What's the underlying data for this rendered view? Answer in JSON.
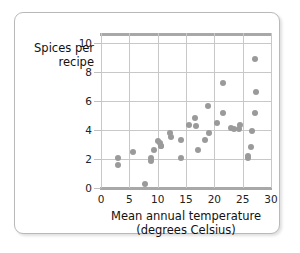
{
  "chart_data": {
    "type": "scatter",
    "title": "",
    "xlabel": "Mean annual temperature (degrees Celsius)",
    "xlabel_line1": "Mean annual temperature",
    "xlabel_line2": "(degrees Celsius)",
    "ylabel": "Spices per recipe",
    "ylabel_line1": "Spices per",
    "ylabel_line2": "recipe",
    "xlim": [
      0,
      30
    ],
    "ylim": [
      0,
      11
    ],
    "xticks": [
      0,
      5,
      10,
      15,
      20,
      25,
      30
    ],
    "yticks": [
      0,
      2,
      4,
      6,
      8,
      10
    ],
    "xtick_labels": [
      "0",
      "5",
      "10",
      "15",
      "20",
      "25",
      "30"
    ],
    "ytick_labels": [
      "0",
      "2",
      "4",
      "6",
      "8",
      "10"
    ],
    "grid": "both",
    "legend": "none",
    "marker_color": "#9a9a9a",
    "gridline_color": "#c8c8c8",
    "axis_color": "#a8a8a8",
    "points": [
      {
        "x": 3.0,
        "y": 2.1
      },
      {
        "x": 3.0,
        "y": 1.6
      },
      {
        "x": 5.6,
        "y": 2.5
      },
      {
        "x": 7.8,
        "y": 0.3
      },
      {
        "x": 8.9,
        "y": 2.1
      },
      {
        "x": 8.9,
        "y": 1.85
      },
      {
        "x": 9.4,
        "y": 2.65
      },
      {
        "x": 10.1,
        "y": 3.25
      },
      {
        "x": 10.4,
        "y": 3.1
      },
      {
        "x": 10.5,
        "y": 2.9
      },
      {
        "x": 10.6,
        "y": 2.9
      },
      {
        "x": 12.2,
        "y": 3.8
      },
      {
        "x": 12.3,
        "y": 3.5
      },
      {
        "x": 14.1,
        "y": 3.3
      },
      {
        "x": 14.1,
        "y": 2.05
      },
      {
        "x": 15.6,
        "y": 4.35
      },
      {
        "x": 16.6,
        "y": 4.8
      },
      {
        "x": 16.7,
        "y": 4.25
      },
      {
        "x": 17.1,
        "y": 2.6
      },
      {
        "x": 18.4,
        "y": 3.3
      },
      {
        "x": 18.8,
        "y": 5.65
      },
      {
        "x": 19.0,
        "y": 3.8
      },
      {
        "x": 20.4,
        "y": 4.5
      },
      {
        "x": 21.5,
        "y": 7.25
      },
      {
        "x": 21.6,
        "y": 5.2
      },
      {
        "x": 23.0,
        "y": 4.15
      },
      {
        "x": 23.4,
        "y": 4.05
      },
      {
        "x": 24.3,
        "y": 4.1
      },
      {
        "x": 24.5,
        "y": 4.35
      },
      {
        "x": 25.9,
        "y": 2.2
      },
      {
        "x": 26.0,
        "y": 2.05
      },
      {
        "x": 26.4,
        "y": 2.85
      },
      {
        "x": 26.6,
        "y": 3.95
      },
      {
        "x": 27.2,
        "y": 5.2
      },
      {
        "x": 27.3,
        "y": 6.6
      },
      {
        "x": 27.2,
        "y": 8.9
      }
    ]
  }
}
